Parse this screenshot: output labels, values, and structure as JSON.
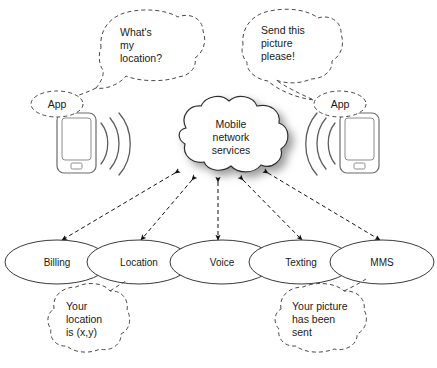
{
  "canvas": {
    "width": 437,
    "height": 368,
    "background": "#ffffff",
    "line_color": "#3a3a3a",
    "dash_color": "#4a4a4a",
    "text_color": "#1a1a1a"
  },
  "cloud": {
    "label_line1": "Mobile",
    "label_line2": "network",
    "label_line3": "services"
  },
  "devices": {
    "left": {
      "app_label": "App",
      "bubble": {
        "line1": "What's",
        "line2": "my",
        "line3": "location?"
      }
    },
    "right": {
      "app_label": "App",
      "bubble": {
        "line1": "Send this",
        "line2": "picture",
        "line3": "please!"
      }
    }
  },
  "services": [
    {
      "label": "Billing"
    },
    {
      "label": "Location"
    },
    {
      "label": "Voice"
    },
    {
      "label": "Texting"
    },
    {
      "label": "MMS"
    }
  ],
  "response_bubbles": {
    "location": {
      "line1": "Your",
      "line2": "location",
      "line3": "is (x,y)"
    },
    "mms": {
      "line1": "Your picture",
      "line2": "has been",
      "line3": "sent"
    }
  }
}
